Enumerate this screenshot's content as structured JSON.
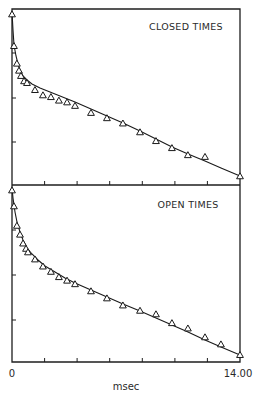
{
  "chart_data": [
    {
      "type": "scatter",
      "title": "CLOSED TIMES",
      "xlabel": "msec",
      "ylabel": "",
      "xlim": [
        0,
        14.0
      ],
      "x_tick_labels": [
        "0",
        "14.00"
      ],
      "x_ticks": [
        0,
        2,
        4,
        6,
        8,
        10,
        12,
        14
      ],
      "y_scale": "log (frequency, arbitrary units)",
      "grid": false,
      "series": [
        {
          "name": "observed",
          "marker": "open-triangle",
          "points": [
            [
              0.0,
              0.97
            ],
            [
              0.12,
              0.79
            ],
            [
              0.3,
              0.69
            ],
            [
              0.43,
              0.65
            ],
            [
              0.55,
              0.62
            ],
            [
              0.74,
              0.59
            ],
            [
              0.92,
              0.58
            ],
            [
              1.41,
              0.54
            ],
            [
              1.9,
              0.51
            ],
            [
              2.39,
              0.5
            ],
            [
              2.88,
              0.48
            ],
            [
              3.38,
              0.47
            ],
            [
              3.87,
              0.45
            ],
            [
              4.85,
              0.41
            ],
            [
              5.83,
              0.38
            ],
            [
              6.81,
              0.35
            ],
            [
              7.86,
              0.3
            ],
            [
              8.84,
              0.25
            ],
            [
              9.82,
              0.21
            ],
            [
              10.8,
              0.17
            ],
            [
              11.85,
              0.16
            ],
            [
              14.0,
              0.05
            ]
          ]
        },
        {
          "name": "fit (two-exponential)",
          "type": "line",
          "points": [
            [
              0.0,
              0.98
            ],
            [
              0.2,
              0.76
            ],
            [
              0.5,
              0.66
            ],
            [
              0.8,
              0.61
            ],
            [
              1.2,
              0.57
            ],
            [
              2.0,
              0.53
            ],
            [
              4.0,
              0.46
            ],
            [
              6.0,
              0.38
            ],
            [
              8.0,
              0.3
            ],
            [
              10.0,
              0.21
            ],
            [
              12.0,
              0.13
            ],
            [
              14.0,
              0.05
            ]
          ]
        }
      ]
    },
    {
      "type": "scatter",
      "title": "OPEN TIMES",
      "xlabel": "msec",
      "ylabel": "",
      "xlim": [
        0,
        14.0
      ],
      "x_tick_labels": [
        "0",
        "14.00"
      ],
      "x_ticks": [
        0,
        2,
        4,
        6,
        8,
        10,
        12,
        14
      ],
      "y_scale": "log (frequency, arbitrary units)",
      "grid": false,
      "series": [
        {
          "name": "observed",
          "marker": "open-triangle",
          "points": [
            [
              0.0,
              0.97
            ],
            [
              0.12,
              0.88
            ],
            [
              0.3,
              0.77
            ],
            [
              0.49,
              0.72
            ],
            [
              0.68,
              0.67
            ],
            [
              0.86,
              0.64
            ],
            [
              0.98,
              0.62
            ],
            [
              1.41,
              0.58
            ],
            [
              1.9,
              0.54
            ],
            [
              2.39,
              0.51
            ],
            [
              2.88,
              0.48
            ],
            [
              3.38,
              0.46
            ],
            [
              3.87,
              0.44
            ],
            [
              4.85,
              0.4
            ],
            [
              5.83,
              0.36
            ],
            [
              6.81,
              0.32
            ],
            [
              7.86,
              0.29
            ],
            [
              8.84,
              0.27
            ],
            [
              9.82,
              0.22
            ],
            [
              10.8,
              0.19
            ],
            [
              11.85,
              0.14
            ],
            [
              12.83,
              0.1
            ],
            [
              14.0,
              0.04
            ]
          ]
        },
        {
          "name": "fit (two-exponential)",
          "type": "line",
          "points": [
            [
              0.0,
              0.98
            ],
            [
              0.3,
              0.8
            ],
            [
              0.6,
              0.71
            ],
            [
              1.0,
              0.64
            ],
            [
              1.5,
              0.58
            ],
            [
              2.0,
              0.54
            ],
            [
              4.0,
              0.44
            ],
            [
              6.0,
              0.36
            ],
            [
              8.0,
              0.28
            ],
            [
              10.0,
              0.2
            ],
            [
              12.0,
              0.12
            ],
            [
              14.0,
              0.04
            ]
          ]
        }
      ]
    }
  ],
  "panels": {
    "top_label": "CLOSED TIMES",
    "bottom_label": "OPEN TIMES"
  },
  "axis": {
    "x_min_label": "0",
    "x_max_label": "14.00",
    "x_unit_label": "msec"
  }
}
